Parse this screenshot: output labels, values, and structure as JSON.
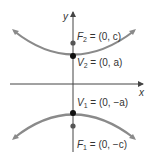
{
  "diagram": {
    "type": "hyperbola",
    "axes": {
      "x_label": "x",
      "y_label": "y"
    },
    "points": [
      {
        "name": "F2",
        "label_var": "F",
        "label_sub": "2",
        "label_rest": " = (0, c)"
      },
      {
        "name": "V2",
        "label_var": "V",
        "label_sub": "2",
        "label_rest": " = (0, a)"
      },
      {
        "name": "V1",
        "label_var": "V",
        "label_sub": "1",
        "label_rest": " = (0, −a)"
      },
      {
        "name": "F1",
        "label_var": "F",
        "label_sub": "1",
        "label_rest": " = (0, −c)"
      }
    ],
    "colors": {
      "curve": "#8a8a8a",
      "axis": "#444444",
      "point": "#111111",
      "focus": "#555555"
    }
  }
}
